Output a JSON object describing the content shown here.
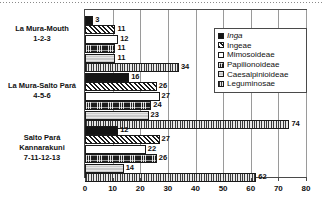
{
  "chart_data": {
    "type": "bar",
    "orientation": "horizontal",
    "title": "",
    "xlabel": "",
    "ylabel": "",
    "xlim": [
      0,
      80
    ],
    "xticks": [
      0,
      10,
      20,
      30,
      40,
      50,
      60,
      70,
      80
    ],
    "grid": true,
    "legend_position": "top-right",
    "categories": [
      "La Mura-Mouth\n1-2-3",
      "La Mura-Salto Pará\n4-5-6",
      "Salto Pará\nKannarakuni\n7-11-12-13"
    ],
    "category_lines": [
      [
        "La Mura-Mouth",
        "1-2-3"
      ],
      [
        "La Mura-Salto Pará",
        "4-5-6"
      ],
      [
        "Salto Pará",
        "Kannarakuni",
        "7-11-12-13"
      ]
    ],
    "series": [
      {
        "name": "Inga",
        "pattern": "solid-black",
        "values": [
          3,
          16,
          12
        ]
      },
      {
        "name": "Ingeae",
        "pattern": "diagonal-hatch",
        "values": [
          11,
          26,
          27
        ]
      },
      {
        "name": "Mimosoideae",
        "pattern": "white-empty",
        "values": [
          12,
          27,
          22
        ]
      },
      {
        "name": "Papilionoideae",
        "pattern": "dark-checker",
        "values": [
          11,
          24,
          26
        ]
      },
      {
        "name": "Caesalpinioideae",
        "pattern": "light-gray",
        "values": [
          11,
          23,
          14
        ]
      },
      {
        "name": "Leguminosae",
        "pattern": "vertical-stripes",
        "values": [
          34,
          74,
          62
        ]
      }
    ]
  },
  "legend": {
    "items": [
      {
        "label": "Inga",
        "italic": true
      },
      {
        "label": "Ingeae",
        "italic": false
      },
      {
        "label": "Mimosoideae",
        "italic": false
      },
      {
        "label": "Papilionoideae",
        "italic": false
      },
      {
        "label": "Caesalpinioideae",
        "italic": false
      },
      {
        "label": "Leguminosae",
        "italic": false
      }
    ]
  },
  "colors": {
    "axis": "#4a4a4a",
    "grid": "#9a9a9a",
    "text": "#101010",
    "background": "#ffffff"
  }
}
